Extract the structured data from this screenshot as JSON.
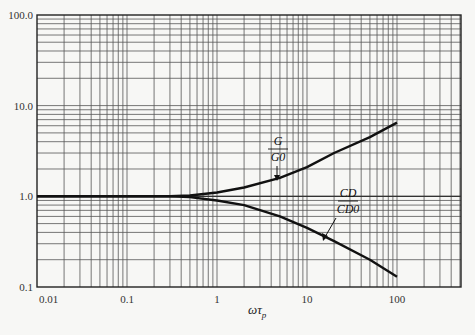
{
  "chart_data": {
    "type": "line",
    "title": "",
    "xlabel": "ωτ_p",
    "ylabel": "",
    "xscale": "log",
    "yscale": "log",
    "xlim": [
      0.01,
      500
    ],
    "ylim": [
      0.1,
      100
    ],
    "grid": true,
    "x_tick_labels": [
      "0.01",
      "0.1",
      "1",
      "10",
      "100"
    ],
    "y_tick_labels": [
      "0.1",
      "1.0",
      "10.0",
      "100.0"
    ],
    "series": [
      {
        "name": "G/G0",
        "x": [
          0.01,
          0.1,
          0.3,
          0.5,
          1,
          2,
          5,
          10,
          20,
          50,
          100
        ],
        "values": [
          1.0,
          1.0,
          1.0,
          1.02,
          1.1,
          1.25,
          1.6,
          2.1,
          3.0,
          4.5,
          6.5
        ]
      },
      {
        "name": "CD/CD0",
        "x": [
          0.01,
          0.1,
          0.3,
          0.5,
          1,
          2,
          5,
          10,
          20,
          50,
          100
        ],
        "values": [
          1.0,
          1.0,
          1.0,
          0.98,
          0.9,
          0.8,
          0.6,
          0.45,
          0.32,
          0.2,
          0.13
        ]
      }
    ],
    "annotations": [
      {
        "label_num": "G",
        "label_den": "G0",
        "points_to": "G/G0"
      },
      {
        "label_num": "CD",
        "label_den": "CD0",
        "points_to": "CD/CD0"
      }
    ]
  },
  "axis": {
    "xlabel_main": "ωτ",
    "xlabel_sub": "p"
  }
}
